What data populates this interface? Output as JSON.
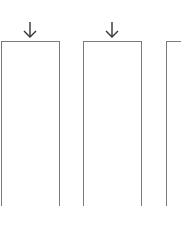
{
  "diagram": {
    "boxes": [
      {
        "id": "box-1",
        "x": 1,
        "width": 59,
        "has_arrow": true
      },
      {
        "id": "box-2",
        "x": 83,
        "width": 59,
        "has_arrow": true
      },
      {
        "id": "box-3",
        "x": 166,
        "width": 30,
        "has_arrow": false
      }
    ],
    "arrows": [
      {
        "id": "arrow-1",
        "direction": "down",
        "target": "box-1"
      },
      {
        "id": "arrow-2",
        "direction": "down",
        "target": "box-2"
      }
    ],
    "colors": {
      "stroke": "#7a7a7a",
      "arrow": "#333333",
      "background": "#ffffff"
    }
  }
}
